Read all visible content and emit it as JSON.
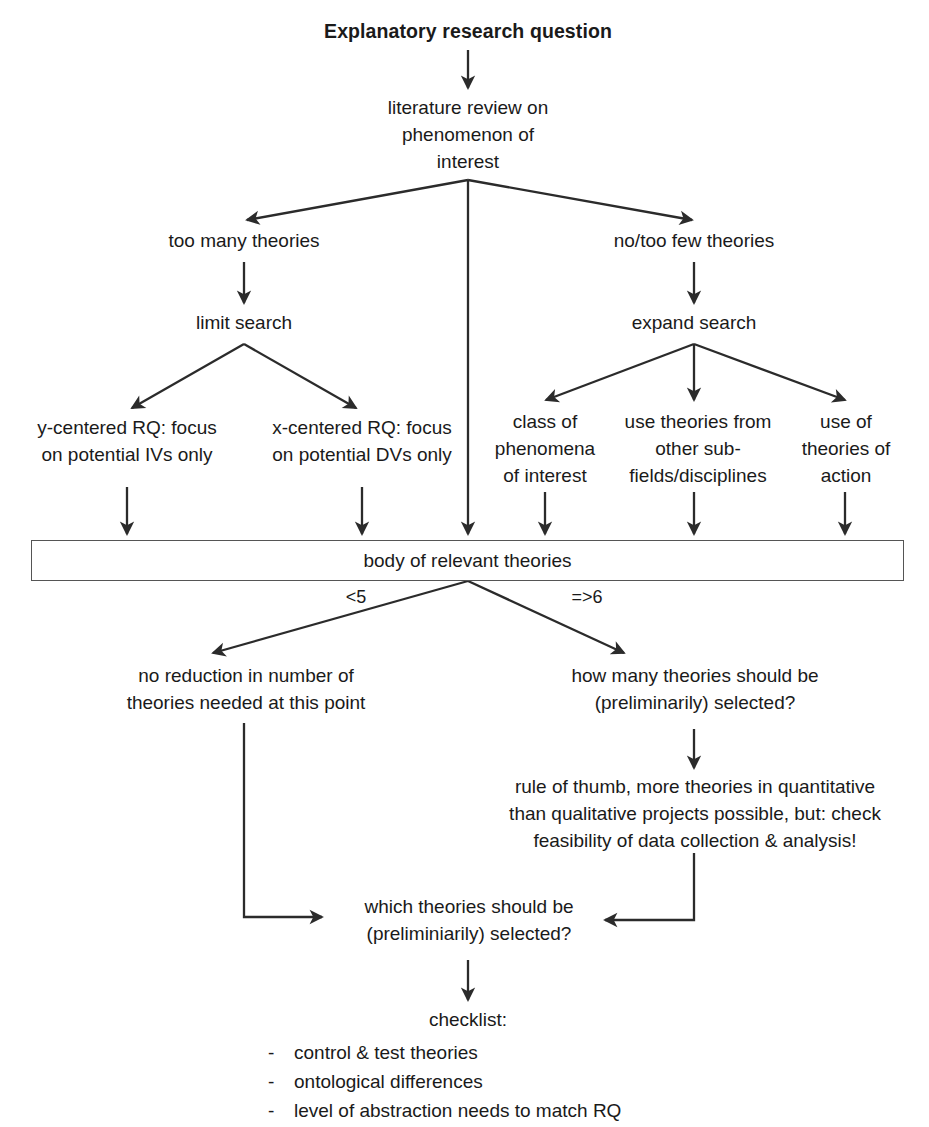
{
  "diagram": {
    "title": "Explanatory research question",
    "nodes": {
      "root": "Explanatory research question",
      "lit_review": "literature review on\nphenomenon of\ninterest",
      "too_many": "too many theories",
      "no_too_few": "no/too few theories",
      "limit_search": "limit search",
      "expand_search": "expand search",
      "y_centered": "y-centered RQ: focus\non potential IVs only",
      "x_centered": "x-centered RQ: focus\non potential DVs only",
      "class_of_phenomena": "class of\nphenomena\nof interest",
      "other_subfields": "use theories from\nother sub-\nfields/disciplines",
      "theories_of_action": "use of\ntheories of\naction",
      "body_of_theories": "body of relevant theories",
      "no_reduction": "no reduction in number of\ntheories needed at this point",
      "how_many": "how many theories should be\n(preliminarily) selected?",
      "rule_of_thumb": "rule of thumb, more theories in quantitative\nthan qualitative projects possible, but: check\nfeasibility of data collection & analysis!",
      "which_theories": "which theories should be\n(preliminiarily) selected?",
      "checklist_title": "checklist:"
    },
    "edge_labels": {
      "less_than_five": "<5",
      "six_or_more": "=>6"
    },
    "checklist": {
      "bullet": "-",
      "items": [
        "control & test theories",
        "ontological differences",
        "level of abstraction needs to match RQ"
      ]
    },
    "colors": {
      "ink": "#1a1a1a",
      "line": "#2b2b2b",
      "box_border": "#555555",
      "background": "#ffffff"
    }
  }
}
